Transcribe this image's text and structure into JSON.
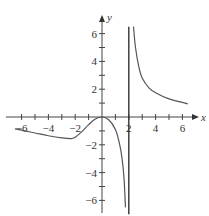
{
  "chart_data": {
    "type": "line",
    "title": "",
    "xlabel": "x",
    "ylabel": "y",
    "xlim": [
      -7,
      7
    ],
    "ylim": [
      -7,
      7
    ],
    "grid": false,
    "x_ticks": [
      -6,
      -5,
      -4,
      -3,
      -2,
      -1,
      1,
      2,
      3,
      4,
      5,
      6
    ],
    "x_tick_labels": [
      {
        "v": -6,
        "t": "−6"
      },
      {
        "v": -4,
        "t": "−4"
      },
      {
        "v": -2,
        "t": "−2"
      },
      {
        "v": 2,
        "t": "2"
      },
      {
        "v": 4,
        "t": "4"
      },
      {
        "v": 6,
        "t": "6"
      }
    ],
    "y_ticks": [
      -6,
      -5,
      -4,
      -3,
      -2,
      -1,
      1,
      2,
      3,
      4,
      5,
      6
    ],
    "y_tick_labels": [
      {
        "v": 6,
        "t": "6"
      },
      {
        "v": 4,
        "t": "4"
      },
      {
        "v": 2,
        "t": "2"
      },
      {
        "v": -2,
        "t": "−2"
      },
      {
        "v": -4,
        "t": "−4"
      },
      {
        "v": -6,
        "t": "−6"
      }
    ],
    "vertical_asymptote": {
      "x": 2,
      "y_range": [
        -7,
        6.5
      ]
    },
    "series": [
      {
        "name": "left branch",
        "points": [
          [
            -6.5,
            -0.85
          ],
          [
            -6,
            -0.95
          ],
          [
            -5,
            -1.15
          ],
          [
            -4,
            -1.35
          ],
          [
            -3,
            -1.5
          ],
          [
            -2.3,
            -1.55
          ],
          [
            -2,
            -1.45
          ],
          [
            -1.5,
            -1.05
          ],
          [
            -1,
            -0.55
          ],
          [
            -0.5,
            -0.15
          ],
          [
            0,
            0
          ],
          [
            0.5,
            -0.2
          ],
          [
            1,
            -0.9
          ],
          [
            1.3,
            -1.9
          ],
          [
            1.5,
            -3
          ],
          [
            1.65,
            -4.5
          ],
          [
            1.75,
            -6.5
          ]
        ]
      },
      {
        "name": "right branch",
        "points": [
          [
            2.35,
            6.5
          ],
          [
            2.5,
            5
          ],
          [
            2.75,
            3.6
          ],
          [
            3,
            2.8
          ],
          [
            3.5,
            2.1
          ],
          [
            4,
            1.75
          ],
          [
            5,
            1.3
          ],
          [
            6,
            1.05
          ],
          [
            6.4,
            0.95
          ]
        ]
      }
    ]
  }
}
